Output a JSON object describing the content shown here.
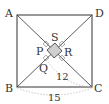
{
  "diagram": {
    "type": "geometry",
    "vertices": {
      "A": "A",
      "B": "B",
      "C": "C",
      "D": "D"
    },
    "inner_square": {
      "P": "P",
      "Q": "Q",
      "R": "R",
      "S": "S"
    },
    "measurements": {
      "BC": "15",
      "QC": "12"
    },
    "colors": {
      "line": "#333333",
      "shade": "#d0d0d0",
      "arc": "#bbbbbb"
    }
  }
}
